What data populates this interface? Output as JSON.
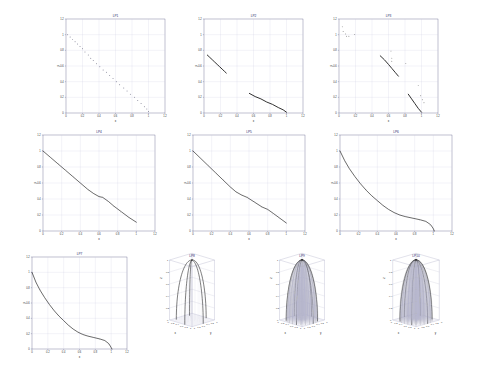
{
  "figure": {
    "background": "#ffffff",
    "line_color": "#1a1a1a",
    "grid_color": "#c9c9dd",
    "axis_color": "#4a4a7a",
    "title_color": "#2b2b6b",
    "rows": 3,
    "columns": 4
  },
  "chart_data": [
    {
      "id": "p1",
      "type": "scatter",
      "title": "LP1",
      "xlabel": "x",
      "ylabel": "y",
      "xlim": [
        0,
        1.2
      ],
      "ylim": [
        0,
        1.2
      ],
      "xticks": [
        0,
        0.2,
        0.4,
        0.6,
        0.8,
        1,
        1.2
      ],
      "xticklabels": [
        "0",
        "0.2",
        "0.4",
        "0.6",
        "0.8",
        "1",
        "1.2"
      ],
      "yticks": [
        0,
        0.2,
        0.4,
        0.6,
        0.8,
        1,
        1.2
      ],
      "yticklabels": [
        "0",
        "0.2",
        "0.4",
        "0.6",
        "0.8",
        "1",
        "1.2"
      ],
      "grid": true,
      "marker": "dot",
      "points_x": [
        0.02,
        0.05,
        0.08,
        0.11,
        0.14,
        0.17,
        0.2,
        0.23,
        0.27,
        0.3,
        0.33,
        0.37,
        0.41,
        0.45,
        0.49,
        0.53,
        0.57,
        0.61,
        0.65,
        0.7,
        0.74,
        0.78,
        0.83,
        0.87,
        0.91,
        0.95,
        0.98,
        1.0
      ],
      "points_y": [
        1.0,
        0.97,
        0.94,
        0.91,
        0.88,
        0.85,
        0.82,
        0.78,
        0.74,
        0.7,
        0.67,
        0.63,
        0.59,
        0.55,
        0.52,
        0.48,
        0.44,
        0.4,
        0.36,
        0.32,
        0.28,
        0.24,
        0.2,
        0.16,
        0.12,
        0.08,
        0.05,
        0.02
      ]
    },
    {
      "id": "p2",
      "type": "scatter",
      "title": "LP2",
      "xlabel": "x",
      "ylabel": "y",
      "xlim": [
        0,
        1.2
      ],
      "ylim": [
        0,
        1.2
      ],
      "xticks": [
        0,
        0.2,
        0.4,
        0.6,
        0.8,
        1,
        1.2
      ],
      "xticklabels": [
        "0",
        "0.2",
        "0.4",
        "0.6",
        "0.8",
        "1",
        "1.2"
      ],
      "yticks": [
        0,
        0.2,
        0.4,
        0.6,
        0.8,
        1,
        1.2
      ],
      "yticklabels": [
        "0",
        "0.2",
        "0.4",
        "0.6",
        "0.8",
        "1",
        "1.2"
      ],
      "grid": true,
      "segments": [
        {
          "name": "upper-arc",
          "x": [
            0.04,
            0.07,
            0.1,
            0.13,
            0.16,
            0.19,
            0.22,
            0.25,
            0.27
          ],
          "y": [
            0.74,
            0.71,
            0.68,
            0.65,
            0.62,
            0.59,
            0.56,
            0.53,
            0.51
          ]
        },
        {
          "name": "lower-segment",
          "x": [
            0.55,
            0.62,
            0.69,
            0.76,
            0.83,
            0.9,
            0.96,
            1.0
          ],
          "y": [
            0.25,
            0.21,
            0.18,
            0.14,
            0.11,
            0.07,
            0.04,
            0.01
          ]
        }
      ]
    },
    {
      "id": "p3",
      "type": "scatter",
      "title": "LP3",
      "xlabel": "x",
      "ylabel": "y",
      "xlim": [
        0,
        1.2
      ],
      "ylim": [
        0,
        1.2
      ],
      "xticks": [
        0,
        0.2,
        0.4,
        0.6,
        0.8,
        1,
        1.2
      ],
      "xticklabels": [
        "0",
        "0.2",
        "0.4",
        "0.6",
        "0.8",
        "1",
        "1.2"
      ],
      "yticks": [
        0,
        0.2,
        0.4,
        0.6,
        0.8,
        1,
        1.2
      ],
      "yticklabels": [
        "0",
        "0.2",
        "0.4",
        "0.6",
        "0.8",
        "1",
        "1.2"
      ],
      "grid": true,
      "segments": [
        {
          "name": "mid-diagonal",
          "x": [
            0.5,
            0.55,
            0.6,
            0.64,
            0.68,
            0.72
          ],
          "y": [
            0.73,
            0.68,
            0.62,
            0.57,
            0.52,
            0.47
          ]
        },
        {
          "name": "lower-diagonal",
          "x": [
            0.84,
            0.88,
            0.92,
            0.96,
            1.0
          ],
          "y": [
            0.24,
            0.18,
            0.12,
            0.06,
            0.01
          ]
        }
      ],
      "outliers_x": [
        0.04,
        0.05,
        0.08,
        0.09,
        0.12,
        0.19,
        0.63,
        0.64,
        0.64,
        0.81,
        0.96,
        0.99,
        1.01,
        1.03
      ],
      "outliers_y": [
        1.1,
        1.04,
        1.01,
        0.98,
        0.98,
        1.0,
        0.79,
        0.7,
        0.66,
        0.63,
        0.35,
        0.22,
        0.17,
        0.13
      ]
    },
    {
      "id": "p4",
      "type": "line",
      "title": "LP4",
      "xlabel": "x",
      "ylabel": "y",
      "xlim": [
        0,
        1.2
      ],
      "ylim": [
        0,
        1.2
      ],
      "xticks": [
        0,
        0.2,
        0.4,
        0.6,
        0.8,
        1,
        1.2
      ],
      "xticklabels": [
        "0",
        "0.2",
        "0.4",
        "0.6",
        "0.8",
        "1",
        "1.2"
      ],
      "yticks": [
        0,
        0.2,
        0.4,
        0.6,
        0.8,
        1,
        1.2
      ],
      "yticklabels": [
        "0",
        "0.2",
        "0.4",
        "0.6",
        "0.8",
        "1",
        "1.2"
      ],
      "grid": true,
      "x": [
        0.0,
        0.08,
        0.16,
        0.24,
        0.32,
        0.4,
        0.48,
        0.54,
        0.6,
        0.64,
        0.7,
        0.76,
        0.84,
        0.92,
        1.0
      ],
      "y": [
        1.0,
        0.92,
        0.84,
        0.76,
        0.68,
        0.6,
        0.52,
        0.47,
        0.43,
        0.42,
        0.37,
        0.31,
        0.24,
        0.17,
        0.11
      ]
    },
    {
      "id": "p5",
      "type": "line",
      "title": "LP5",
      "xlabel": "x",
      "ylabel": "y",
      "xlim": [
        0,
        1.2
      ],
      "ylim": [
        0,
        1.2
      ],
      "xticks": [
        0,
        0.2,
        0.4,
        0.6,
        0.8,
        1,
        1.2
      ],
      "xticklabels": [
        "0",
        "0.2",
        "0.4",
        "0.6",
        "0.8",
        "1",
        "1.2"
      ],
      "yticks": [
        0,
        0.2,
        0.4,
        0.6,
        0.8,
        1,
        1.2
      ],
      "yticklabels": [
        "0",
        "0.2",
        "0.4",
        "0.6",
        "0.8",
        "1",
        "1.2"
      ],
      "grid": true,
      "x": [
        0.0,
        0.08,
        0.16,
        0.24,
        0.32,
        0.4,
        0.46,
        0.52,
        0.58,
        0.66,
        0.74,
        0.8,
        0.86,
        0.93,
        1.0
      ],
      "y": [
        1.0,
        0.91,
        0.82,
        0.73,
        0.64,
        0.55,
        0.49,
        0.45,
        0.42,
        0.36,
        0.3,
        0.27,
        0.22,
        0.16,
        0.1
      ]
    },
    {
      "id": "p6",
      "type": "line",
      "title": "LP6",
      "xlabel": "x",
      "ylabel": "y",
      "xlim": [
        0,
        1.2
      ],
      "ylim": [
        0,
        1.2
      ],
      "xticks": [
        0,
        0.2,
        0.4,
        0.6,
        0.8,
        1,
        1.2
      ],
      "xticklabels": [
        "0",
        "0.2",
        "0.4",
        "0.6",
        "0.8",
        "1",
        "1.2"
      ],
      "yticks": [
        0,
        0.2,
        0.4,
        0.6,
        0.8,
        1,
        1.2
      ],
      "yticklabels": [
        "0",
        "0.2",
        "0.4",
        "0.6",
        "0.8",
        "1",
        "1.2"
      ],
      "grid": true,
      "x": [
        0.0,
        0.05,
        0.1,
        0.16,
        0.22,
        0.28,
        0.34,
        0.4,
        0.46,
        0.52,
        0.58,
        0.64,
        0.7,
        0.78,
        0.86,
        0.92,
        0.97,
        1.0,
        1.01
      ],
      "y": [
        1.0,
        0.88,
        0.78,
        0.68,
        0.59,
        0.51,
        0.44,
        0.38,
        0.32,
        0.27,
        0.23,
        0.2,
        0.18,
        0.16,
        0.14,
        0.12,
        0.08,
        0.03,
        0.0
      ]
    },
    {
      "id": "p7",
      "type": "line",
      "title": "LP7",
      "xlabel": "x",
      "ylabel": "y",
      "xlim": [
        0,
        1.2
      ],
      "ylim": [
        0,
        1.2
      ],
      "xticks": [
        0,
        0.2,
        0.4,
        0.6,
        0.8,
        1,
        1.2
      ],
      "xticklabels": [
        "0",
        "0.2",
        "0.4",
        "0.6",
        "0.8",
        "1",
        "1.2"
      ],
      "yticks": [
        0,
        0.2,
        0.4,
        0.6,
        0.8,
        1,
        1.2
      ],
      "yticklabels": [
        "0",
        "0.2",
        "0.4",
        "0.6",
        "0.8",
        "1",
        "1.2"
      ],
      "grid": true,
      "x": [
        0.0,
        0.05,
        0.1,
        0.16,
        0.22,
        0.28,
        0.34,
        0.4,
        0.46,
        0.52,
        0.58,
        0.64,
        0.7,
        0.78,
        0.86,
        0.92,
        0.97,
        1.0,
        1.01
      ],
      "y": [
        1.0,
        0.87,
        0.77,
        0.67,
        0.58,
        0.5,
        0.43,
        0.37,
        0.31,
        0.26,
        0.22,
        0.19,
        0.17,
        0.15,
        0.13,
        0.11,
        0.07,
        0.02,
        0.0
      ]
    },
    {
      "id": "p8",
      "type": "surface3d",
      "title": "LP8",
      "xlabel": "x",
      "ylabel": "y",
      "zlabel": "z",
      "xlim": [
        0,
        1
      ],
      "ylim": [
        0,
        1
      ],
      "zlim": [
        0,
        1
      ],
      "xticklabels": [
        "0",
        "0.2",
        "0.4",
        "0.6",
        "0.8",
        "1"
      ],
      "yticklabels": [
        "0",
        "0.2",
        "0.4",
        "0.6",
        "0.8",
        "1"
      ],
      "zticklabels": [
        "0",
        "0.2",
        "0.4",
        "0.6",
        "0.8",
        "1"
      ],
      "grid": true,
      "mesh_density": "sparse",
      "ribs": 5,
      "shape": "dome"
    },
    {
      "id": "p9",
      "type": "surface3d",
      "title": "LP9",
      "xlabel": "x",
      "ylabel": "y",
      "zlabel": "z",
      "xlim": [
        0,
        1
      ],
      "ylim": [
        0,
        1
      ],
      "zlim": [
        0,
        1
      ],
      "xticklabels": [
        "0",
        "0.2",
        "0.4",
        "0.6",
        "0.8",
        "1"
      ],
      "yticklabels": [
        "0",
        "0.2",
        "0.4",
        "0.6",
        "0.8",
        "1"
      ],
      "zticklabels": [
        "0",
        "0.2",
        "0.4",
        "0.6",
        "0.8",
        "1"
      ],
      "grid": true,
      "mesh_density": "dense",
      "ribs": 22,
      "shape": "dome"
    },
    {
      "id": "p10",
      "type": "surface3d",
      "title": "LP10",
      "xlabel": "x",
      "ylabel": "y",
      "zlabel": "z",
      "xlim": [
        0,
        1
      ],
      "ylim": [
        0,
        1
      ],
      "zlim": [
        0,
        1
      ],
      "xticklabels": [
        "0",
        "0.2",
        "0.4",
        "0.6",
        "0.8",
        "1"
      ],
      "yticklabels": [
        "0",
        "0.2",
        "0.4",
        "0.6",
        "0.8",
        "1"
      ],
      "zticklabels": [
        "0",
        "0.2",
        "0.4",
        "0.6",
        "0.8",
        "1"
      ],
      "grid": true,
      "mesh_density": "dense",
      "ribs": 24,
      "shape": "dome"
    }
  ]
}
